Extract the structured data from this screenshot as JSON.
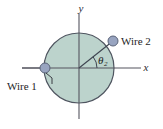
{
  "figure": {
    "kind": "physics-diagram",
    "background_color": "#ffffff"
  },
  "axes": {
    "x_label": "x",
    "y_label": "y",
    "axis_color": "#55555f",
    "origin": {
      "x": 79,
      "y": 68
    },
    "x_extent": {
      "from": 22,
      "to": 141
    },
    "y_extent": {
      "from": 14,
      "to": 119
    }
  },
  "disk": {
    "name": "conductor-cross-section",
    "center": {
      "x": 79,
      "y": 68
    },
    "radius": 35,
    "fill_color": "#bcd3cc",
    "stroke_color": "#4f5560"
  },
  "wires": [
    {
      "id": "wire-1",
      "label": "Wire 1",
      "position": {
        "x": 45,
        "y": 68
      },
      "dot_radius": 5,
      "dot_fill": "#98a4c0",
      "dot_stroke": "#5a6378",
      "label_x": 7,
      "label_y": 89,
      "leader": {
        "x1": 46,
        "y1": 74,
        "x2": 52,
        "y2": 83
      },
      "stub": {
        "x1": 22,
        "y1": 68,
        "x2": 40,
        "y2": 68
      }
    },
    {
      "id": "wire-2",
      "label": "Wire 2",
      "position": {
        "x": 113,
        "y": 41
      },
      "dot_radius": 5,
      "dot_fill": "#98a4c0",
      "dot_stroke": "#5a6378",
      "label_x": 121,
      "label_y": 45
    }
  ],
  "angle": {
    "symbol": "θ",
    "subscript": "2",
    "value_degrees": 38,
    "label_x": 99,
    "label_y": 63,
    "arc_radius": 18,
    "vertex": {
      "x": 79,
      "y": 68
    },
    "radius_line": {
      "x1": 79,
      "y1": 68,
      "x2": 113,
      "y2": 41
    }
  }
}
